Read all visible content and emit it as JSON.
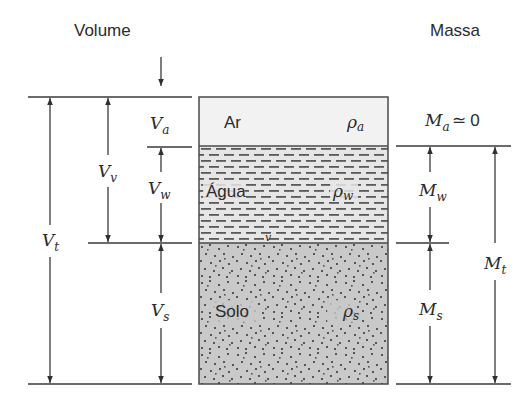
{
  "headers": {
    "volume": "Volume",
    "mass": "Massa"
  },
  "phases": [
    {
      "name": "Ar",
      "density_symbol": "ρ",
      "density_sub": "a",
      "fill": "#f2f2f2",
      "y_top": 97,
      "y_bottom": 146
    },
    {
      "name": "Água",
      "density_symbol": "ρ",
      "density_sub": "w",
      "fill": "#e6e6e6",
      "y_top": 146,
      "y_bottom": 243
    },
    {
      "name": "Solo",
      "density_symbol": "ρ",
      "density_sub": "s",
      "fill": "#c9c9c9",
      "y_top": 243,
      "y_bottom": 384
    }
  ],
  "stray_mark": "v",
  "volume_labels": {
    "Va": {
      "main": "V",
      "sub": "a"
    },
    "Vv": {
      "main": "V",
      "sub": "v"
    },
    "Vw": {
      "main": "V",
      "sub": "w"
    },
    "Vt": {
      "main": "V",
      "sub": "t"
    },
    "Vs": {
      "main": "V",
      "sub": "s"
    }
  },
  "mass_labels": {
    "Ma": {
      "main": "M",
      "sub": "a",
      "suffix": "≃ 0"
    },
    "Mw": {
      "main": "M",
      "sub": "w"
    },
    "Mt": {
      "main": "M",
      "sub": "t"
    },
    "Ms": {
      "main": "M",
      "sub": "s"
    }
  },
  "colors": {
    "line": "#3a3a3a",
    "text": "#2b2b2b",
    "soil_dot": "#555555",
    "water_dash": "#5a5a5a"
  }
}
